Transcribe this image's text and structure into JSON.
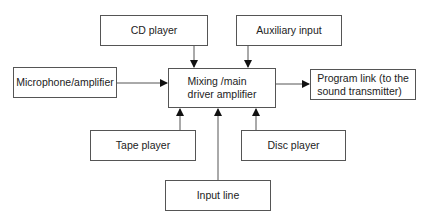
{
  "diagram": {
    "nodes": {
      "cd_player": {
        "label": "CD player"
      },
      "auxiliary_input": {
        "label": "Auxiliary input"
      },
      "microphone_amplifier": {
        "label": "Microphone/amplifier"
      },
      "mixer": {
        "label": "Mixing /main\ndriver amplifier"
      },
      "program_link": {
        "label": "Program link (to the\nsound transmitter)"
      },
      "tape_player": {
        "label": "Tape player"
      },
      "disc_player": {
        "label": "Disc player"
      },
      "input_line": {
        "label": "Input line"
      }
    },
    "edges": [
      {
        "from": "cd_player",
        "to": "mixer"
      },
      {
        "from": "auxiliary_input",
        "to": "mixer"
      },
      {
        "from": "microphone_amplifier",
        "to": "mixer"
      },
      {
        "from": "tape_player",
        "to": "mixer"
      },
      {
        "from": "input_line",
        "to": "mixer"
      },
      {
        "from": "disc_player",
        "to": "mixer"
      },
      {
        "from": "mixer",
        "to": "program_link"
      }
    ]
  }
}
